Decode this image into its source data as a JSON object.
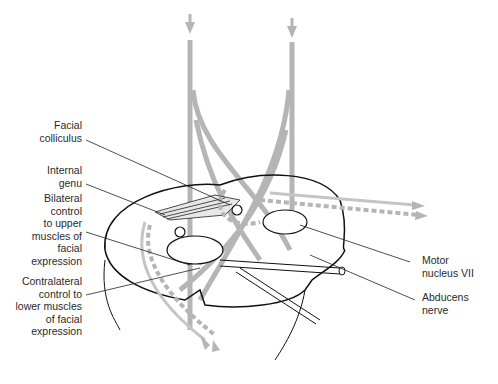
{
  "diagram": {
    "colors": {
      "background": "#ffffff",
      "outline": "#111111",
      "tract": "#b5b5b5",
      "label_text": "#2a2a2a"
    },
    "labels": {
      "facial_colliculus": "Facial\ncolliculus",
      "internal_genu": "Internal\ngenu",
      "bilateral_control": "Bilateral\ncontrol\nto upper\nmuscles of\nfacial\nexpression",
      "contralateral_control": "Contralateral\ncontrol to\nlower muscles\nof facial\nexpression",
      "motor_nucleus": "Motor\nnucleus VII",
      "abducens_nerve": "Abducens\nnerve"
    }
  }
}
